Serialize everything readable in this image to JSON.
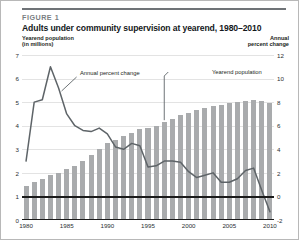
{
  "figure": {
    "number_label": "FIGURE 1",
    "title": "Adults under community supervision at yearend, 1980–2010",
    "left_axis_label_line1": "Yearend population",
    "left_axis_label_line2": "(in millions)",
    "right_axis_label_line1": "Annual",
    "right_axis_label_line2": "percent change"
  },
  "colors": {
    "bar": "#a9abad",
    "line": "#5e6468",
    "axis": "#1a1a1a",
    "grid": "#e3e3e3",
    "rule": "#6f7377",
    "fig_num_text": "#7a7e82",
    "title_text": "#14181b",
    "border": "#b8b8b8"
  },
  "chart_data": {
    "type": "bar",
    "title": "Adults under community supervision at yearend, 1980–2010",
    "xlabel": "",
    "ylabel": "Yearend population (in millions)",
    "y2label": "Annual percent change",
    "ylim": [
      0,
      7
    ],
    "y2lim": [
      -2,
      12
    ],
    "grid": true,
    "legend_position": "annotations-inline",
    "x": [
      1980,
      1981,
      1982,
      1983,
      1984,
      1985,
      1986,
      1987,
      1988,
      1989,
      1990,
      1991,
      1992,
      1993,
      1994,
      1995,
      1996,
      1997,
      1998,
      1999,
      2000,
      2001,
      2002,
      2003,
      2004,
      2005,
      2006,
      2007,
      2008,
      2009,
      2010
    ],
    "yticks_left": [
      0,
      1,
      2,
      3,
      4,
      5,
      6,
      7
    ],
    "yticks_right": [
      -2,
      0,
      2,
      4,
      6,
      8,
      10,
      12
    ],
    "xticks": [
      1980,
      1985,
      1990,
      1995,
      2000,
      2005,
      2010
    ],
    "series": [
      {
        "name": "Yearend population",
        "type": "bar",
        "axis": "left",
        "units": "millions",
        "values": [
          1.45,
          1.6,
          1.75,
          1.9,
          2.0,
          2.15,
          2.3,
          2.5,
          2.75,
          3.0,
          3.25,
          3.4,
          3.55,
          3.7,
          3.85,
          3.9,
          4.0,
          4.15,
          4.3,
          4.45,
          4.55,
          4.65,
          4.75,
          4.85,
          4.9,
          4.95,
          5.0,
          5.05,
          5.1,
          5.05,
          4.95
        ]
      },
      {
        "name": "Annual percent change",
        "type": "line",
        "axis": "right",
        "units": "percent",
        "values": [
          3.0,
          8.0,
          8.2,
          11.0,
          9.2,
          7.0,
          6.0,
          5.6,
          5.5,
          5.8,
          5.3,
          4.2,
          4.0,
          4.5,
          4.3,
          2.5,
          2.6,
          3.0,
          3.0,
          2.9,
          2.1,
          1.6,
          1.8,
          2.0,
          1.2,
          1.2,
          1.5,
          2.2,
          2.4,
          0.5,
          -1.3
        ]
      }
    ],
    "annotations": [
      {
        "text": "Annual percent change",
        "near_x": 1984,
        "points_to_series": "Annual percent change"
      },
      {
        "text": "Yearend population",
        "near_x": 1997,
        "points_to_series": "Yearend population"
      }
    ]
  }
}
